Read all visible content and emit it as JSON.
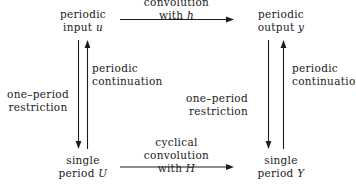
{
  "diagram": {
    "background_color": "#ffffff",
    "ink_color": "#1d1d1d",
    "nodes": {
      "top_left": {
        "line1": "periodic",
        "line2_prefix": "input ",
        "line2_symbol": "u"
      },
      "top_right": {
        "line1": "periodic",
        "line2_prefix": "output ",
        "line2_symbol": "y"
      },
      "bottom_left": {
        "line1": "single",
        "line2_prefix": "period ",
        "line2_symbol": "U"
      },
      "bottom_right": {
        "line1": "single",
        "line2_prefix": "period ",
        "line2_symbol": "Y"
      }
    },
    "edges": {
      "top": {
        "line1": "convolution",
        "line2_prefix": "with ",
        "line2_symbol": "h",
        "direction": "right"
      },
      "bottom": {
        "line1": "cyclical",
        "line2": "convolution",
        "line3_prefix": "with ",
        "line3_symbol": "H",
        "direction": "right"
      },
      "left_down": {
        "line1": "one–period",
        "line2": "restriction",
        "direction": "down"
      },
      "left_up": {
        "line1": "periodic",
        "line2": "continuation",
        "direction": "up"
      },
      "right_down": {
        "line1": "one–period",
        "line2": "restriction",
        "direction": "down"
      },
      "right_up": {
        "line1": "periodic",
        "line2": "continuation",
        "direction": "up"
      }
    }
  }
}
